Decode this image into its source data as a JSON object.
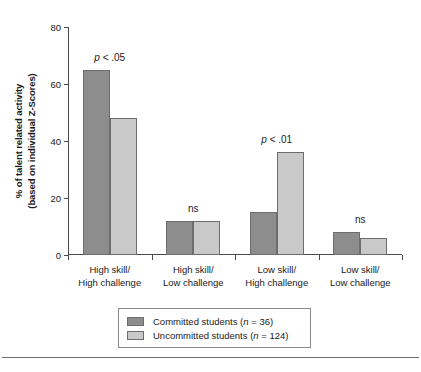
{
  "chart_data": {
    "type": "bar",
    "title": "",
    "subtitle": "",
    "xlabel": "",
    "ylabel_lines": [
      "% of talent related activity",
      "(based on individual Z-Scores)"
    ],
    "ylabel": "% of talent related activity (based on individual Z-Scores)",
    "ylim": [
      0,
      80
    ],
    "yticks": [
      0,
      20,
      40,
      60,
      80
    ],
    "ytick_labels": [
      "0",
      "20",
      "40",
      "60",
      "80"
    ],
    "grid": false,
    "legend_position": "bottom",
    "categories": [
      "High skill/ High challenge",
      "High skill/ Low challenge",
      "Low skill/ High challenge",
      "Low skill/ Low challenge"
    ],
    "category_lines": [
      [
        "High skill/",
        "High challenge"
      ],
      [
        "High skill/",
        "Low challenge"
      ],
      [
        "Low skill/",
        "High challenge"
      ],
      [
        "Low skill/",
        "Low challenge"
      ]
    ],
    "series": [
      {
        "name": "Committed students (n = 36)",
        "short_name": "Committed students",
        "n": 36,
        "color": "#8d8d8d",
        "values": [
          65,
          12,
          15,
          8
        ]
      },
      {
        "name": "Uncommitted students (n = 124)",
        "short_name": "Uncommitted students",
        "n": 124,
        "color": "#c9c9c9",
        "values": [
          48,
          12,
          36,
          6
        ]
      }
    ],
    "annotations": [
      {
        "category_index": 0,
        "text": "p < .05",
        "italic_part": "p",
        "rest": " < .05"
      },
      {
        "category_index": 1,
        "text": "ns",
        "italic_part": "",
        "rest": "ns"
      },
      {
        "category_index": 2,
        "text": "p < .01",
        "italic_part": "p",
        "rest": " < .01"
      },
      {
        "category_index": 3,
        "text": "ns",
        "italic_part": "",
        "rest": "ns"
      }
    ]
  },
  "legend": {
    "entries": [
      {
        "label_prefix": "Committed students (",
        "italic": "n",
        "label_suffix": " = 36)"
      },
      {
        "label_prefix": "Uncommitted students (",
        "italic": "n",
        "label_suffix": " = 124)"
      }
    ]
  },
  "axis": {
    "y_title_line1": "% of talent related activity",
    "y_title_line2": "(based on individual Z-Scores)"
  }
}
